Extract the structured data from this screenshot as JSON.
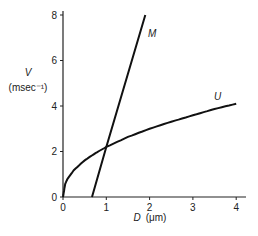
{
  "chart_data": {
    "type": "line",
    "title": "",
    "xlabel": "D (μm)",
    "xlabel_var": "D",
    "xlabel_unit": "(μm)",
    "ylabel": "V (msec⁻¹)",
    "ylabel_var": "V",
    "ylabel_unit": "(msec⁻¹)",
    "xlim": [
      0,
      4
    ],
    "ylim": [
      0,
      8
    ],
    "xticks": [
      0,
      1,
      2,
      3,
      4
    ],
    "yticks": [
      0,
      2,
      4,
      6,
      8
    ],
    "xtick_labels": [
      "0",
      "1",
      "2",
      "3",
      "4"
    ],
    "ytick_labels": [
      "0",
      "2",
      "4",
      "6",
      "8"
    ],
    "grid": false,
    "legend": "none (curves labeled inline)",
    "series": [
      {
        "name": "M",
        "label": "M",
        "shape": "straight line",
        "x": [
          0.67,
          1.0,
          1.9
        ],
        "y": [
          0.0,
          2.2,
          8.0
        ]
      },
      {
        "name": "U",
        "label": "U",
        "shape": "concave power-law curve",
        "x": [
          0,
          0.05,
          0.1,
          0.25,
          0.5,
          0.75,
          1.0,
          1.5,
          2.0,
          2.5,
          3.0,
          3.5,
          4.0
        ],
        "y": [
          0,
          0.57,
          0.78,
          1.18,
          1.61,
          1.93,
          2.2,
          2.64,
          3.0,
          3.31,
          3.59,
          3.87,
          4.1
        ]
      }
    ],
    "annotations": [
      {
        "text": "M",
        "near": "top end of M line"
      },
      {
        "text": "U",
        "near": "right end of U curve"
      }
    ]
  }
}
